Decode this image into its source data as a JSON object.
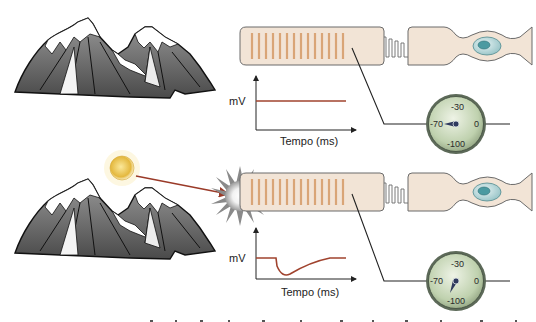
{
  "colors": {
    "cell_fill": "#f2e4d6",
    "cell_stroke": "#6b6b6b",
    "disc_stripe": "#d9a577",
    "nucleus_outer": "#c9e3e5",
    "nucleus_inner": "#3f8f98",
    "trace": "#a0432e",
    "sun": "#e6c24a",
    "light_ray": "#9a3a28",
    "dial_face": "#c7d7b8",
    "dial_rim": "#6e7b6a",
    "needle": "#2f3a5e"
  },
  "panels": [
    {
      "id": "dark",
      "graph": {
        "ylabel": "mV",
        "xlabel": "Tempo (ms)",
        "trace": "flat"
      },
      "meter": {
        "labels": {
          "top": "-30",
          "left": "-70",
          "right": "0",
          "bottom": "-100"
        },
        "needle_value": "-70"
      },
      "light": false
    },
    {
      "id": "light",
      "graph": {
        "ylabel": "mV",
        "xlabel": "Tempo (ms)",
        "trace": "hyperpolarization"
      },
      "meter": {
        "labels": {
          "top": "-30",
          "left": "-70",
          "right": "0",
          "bottom": "-100"
        },
        "needle_value": "-100"
      },
      "light": true
    }
  ]
}
